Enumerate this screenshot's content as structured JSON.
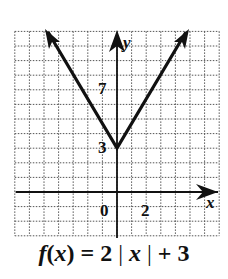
{
  "chart_data": {
    "type": "line",
    "function": "f(x) = 2|x| + 3",
    "xlabel": "x",
    "ylabel": "y",
    "xlim": [
      -7,
      7
    ],
    "ylim": [
      -3,
      11
    ],
    "grid": true,
    "tick_labels": {
      "x": [
        "0",
        "2"
      ],
      "y": [
        "3",
        "7"
      ]
    },
    "series": [
      {
        "name": "f(x) = 2|x| + 3",
        "x": [
          -4,
          -3,
          -2,
          -1,
          0,
          1,
          2,
          3,
          4
        ],
        "y": [
          11,
          9,
          7,
          5,
          3,
          5,
          7,
          9,
          11
        ]
      }
    ],
    "vertex": [
      0,
      3
    ],
    "arrows_at_ends": true
  },
  "labels": {
    "x_axis": "x",
    "y_axis": "y",
    "tick_0": "0",
    "tick_x2": "2",
    "tick_y3": "3",
    "tick_y7": "7"
  },
  "caption": {
    "prefix": "f(",
    "var": "x",
    "mid": ") = 2",
    "abs_open": "|",
    "abs_var": "x",
    "abs_close": "|",
    "suffix": "+ 3"
  }
}
